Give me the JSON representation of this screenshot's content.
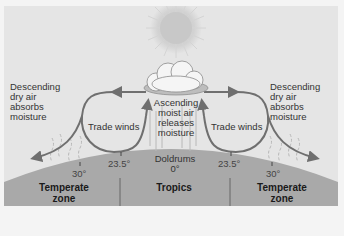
{
  "diagram": {
    "type": "atmospheric-circulation",
    "labels": {
      "left_descending": [
        "Descending",
        "dry air",
        "absorbs",
        "moisture"
      ],
      "right_descending": [
        "Descending",
        "dry air",
        "absorbs",
        "moisture"
      ],
      "center_ascending": [
        "Ascending",
        "moist air",
        "releases",
        "moisture"
      ],
      "left_trade_winds": "Trade winds",
      "right_trade_winds": "Trade winds",
      "doldrums": "Doldrums",
      "doldrums_lat": "0°"
    },
    "latitudes": {
      "left_30": "30°",
      "left_23_5": "23.5°",
      "right_23_5": "23.5°",
      "right_30": "30°"
    },
    "zones": [
      {
        "line1": "Temperate",
        "line2": "zone"
      },
      {
        "line1": "Tropics",
        "line2": ""
      },
      {
        "line1": "Temperate",
        "line2": "zone"
      }
    ],
    "icons": [
      "sun-icon",
      "cloud-icon"
    ],
    "colors": {
      "sky": "#e5e5e5",
      "ground": "#a9a9a9",
      "arrow": "#6f6f6f",
      "text": "#333333"
    }
  }
}
